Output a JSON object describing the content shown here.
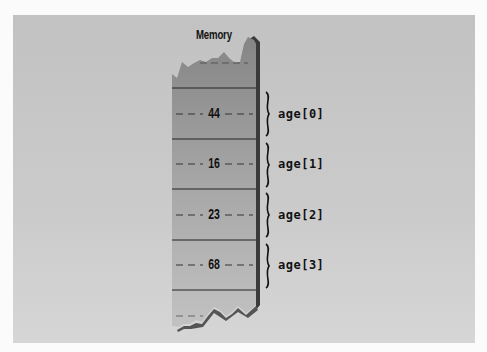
{
  "diagram": {
    "title": "Memory",
    "cells": [
      {
        "value": "44",
        "label": "age[0]"
      },
      {
        "value": "16",
        "label": "age[1]"
      },
      {
        "value": "23",
        "label": "age[2]"
      },
      {
        "value": "68",
        "label": "age[3]"
      }
    ],
    "colors": {
      "background": "#fbfbfb",
      "panel": "#c6c6c6",
      "column_top": "#8a8a8a",
      "column_bottom": "#bdbdbd",
      "text": "#111111"
    }
  }
}
